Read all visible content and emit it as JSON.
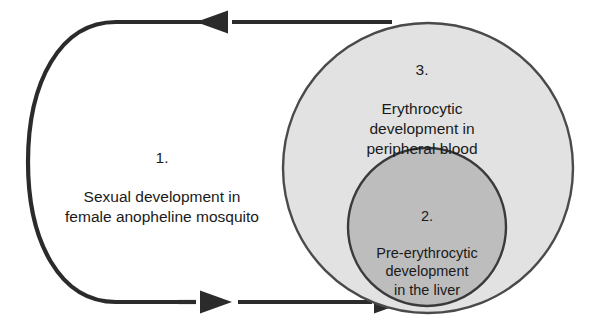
{
  "diagram": {
    "type": "cycle-with-nested-circles",
    "colors": {
      "outline": "#2b2b2b",
      "outer_circle_fill": "#e2e2e2",
      "outer_circle_stroke": "#4a4a4a",
      "inner_circle_fill": "#bdbdbd",
      "inner_circle_stroke": "#3a3a3a",
      "text": "#1a1a1a",
      "background": "#ffffff"
    },
    "stages": [
      {
        "id": "stage-1",
        "number": "1.",
        "text": "Sexual development in\nfemale anopheline mosquito",
        "region": "mosquito"
      },
      {
        "id": "stage-2",
        "number": "2.",
        "text": "Pre-erythrocytic\ndevelopment\nin the liver",
        "region": "liver"
      },
      {
        "id": "stage-3",
        "number": "3.",
        "text": "Erythrocytic\ndevelopment in\nperipheral blood",
        "region": "peripheral-blood"
      }
    ],
    "arrows": [
      {
        "id": "arrow-top",
        "direction": "left",
        "description": "top arrow pointing left from blood stage toward mosquito stage",
        "arrowhead_count": 1
      },
      {
        "id": "arrow-bottom",
        "direction": "right",
        "description": "bottom arrow pointing right from mosquito stage toward liver stage",
        "arrowhead_count": 2
      }
    ]
  }
}
